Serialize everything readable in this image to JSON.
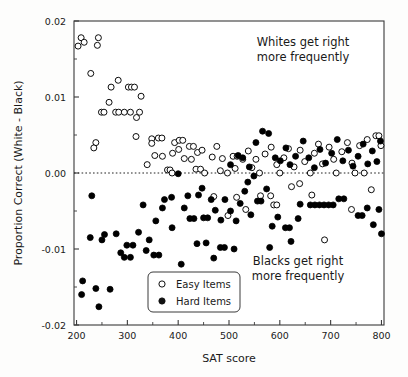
{
  "chart_data": {
    "type": "scatter",
    "title": "",
    "xlabel": "SAT score",
    "ylabel": "Proportion Correct (White - Black)",
    "xlim": [
      195,
      805
    ],
    "ylim": [
      -0.02,
      0.02
    ],
    "xticks": [
      200,
      300,
      400,
      500,
      600,
      700,
      800
    ],
    "xtick_labels": [
      "200",
      "300",
      "400",
      "500",
      "600",
      "700",
      "800"
    ],
    "xminor_step": 50,
    "yticks": [
      -0.02,
      -0.01,
      0.0,
      0.01,
      0.02
    ],
    "ytick_labels": [
      "-0.02",
      "-0.01",
      "0.00",
      "0.01",
      "0.02"
    ],
    "yminor_step": 0.005,
    "grid": false,
    "reference_line": {
      "y": 0.0,
      "style": "dotted"
    },
    "legend": {
      "position": "lower-center-left",
      "entries": [
        {
          "label": "Easy Items",
          "marker": "open-circle"
        },
        {
          "label": "Hard Items",
          "marker": "filled-circle"
        }
      ]
    },
    "annotations": [
      {
        "id": "whites-annotation",
        "line1": "Whites get right",
        "line2": "more frequently",
        "x": 610,
        "y": 0.0168
      },
      {
        "id": "blacks-annotation",
        "line1": "Blacks get right",
        "line2": "more frequently",
        "x": 600,
        "y": -0.0132
      }
    ],
    "series": [
      {
        "name": "Easy Items",
        "marker": "open-circle",
        "color": "#000000",
        "points": [
          [
            203,
            0.0167
          ],
          [
            209,
            0.0178
          ],
          [
            215,
            0.0172
          ],
          [
            243,
            0.0178
          ],
          [
            241,
            0.0168
          ],
          [
            228,
            0.0131
          ],
          [
            249,
            0.008
          ],
          [
            254,
            0.008
          ],
          [
            268,
            0.0113
          ],
          [
            264,
            0.0093
          ],
          [
            282,
            0.0122
          ],
          [
            277,
            0.008
          ],
          [
            283,
            0.008
          ],
          [
            294,
            0.008
          ],
          [
            302,
            0.0113
          ],
          [
            308,
            0.0113
          ],
          [
            314,
            0.0113
          ],
          [
            306,
            0.008
          ],
          [
            318,
            0.0073
          ],
          [
            327,
            0.0101
          ],
          [
            324,
            0.008
          ],
          [
            317,
            0.0048
          ],
          [
            238,
            0.004
          ],
          [
            234,
            0.0033
          ],
          [
            348,
            0.0045
          ],
          [
            348,
            0.0039
          ],
          [
            361,
            0.0046
          ],
          [
            368,
            0.0046
          ],
          [
            354,
            0.0023
          ],
          [
            369,
            0.0022
          ],
          [
            339,
            0.0011
          ],
          [
            379,
            0.0004
          ],
          [
            384,
            0.0004
          ],
          [
            393,
            0.004
          ],
          [
            389,
            0.0026
          ],
          [
            402,
            0.0043
          ],
          [
            409,
            0.0043
          ],
          [
            401,
            0.0031
          ],
          [
            412,
            0.0019
          ],
          [
            388,
            0.0
          ],
          [
            422,
            0.0035
          ],
          [
            430,
            0.0035
          ],
          [
            426,
            0.0018
          ],
          [
            438,
            0.0027
          ],
          [
            447,
            0.003
          ],
          [
            435,
            0.0005
          ],
          [
            444,
            0.0005
          ],
          [
            452,
            0.0
          ],
          [
            467,
            0.0021
          ],
          [
            476,
            0.0035
          ],
          [
            487,
            0.0019
          ],
          [
            483,
            0.0003
          ],
          [
            497,
            0.0
          ],
          [
            508,
            0.0022
          ],
          [
            516,
            0.0022
          ],
          [
            512,
            0.0006
          ],
          [
            527,
            0.0018
          ],
          [
            538,
            0.0029
          ],
          [
            545,
            0.0007
          ],
          [
            553,
            0.0018
          ],
          [
            560,
            0.0
          ],
          [
            571,
            0.0025
          ],
          [
            583,
            0.0034
          ],
          [
            594,
            0.0011
          ],
          [
            600,
            0.0
          ],
          [
            608,
            0.002
          ],
          [
            617,
            0.0032
          ],
          [
            628,
            0.0008
          ],
          [
            640,
            0.003
          ],
          [
            649,
            0.0015
          ],
          [
            660,
            0.0
          ],
          [
            668,
            0.0026
          ],
          [
            676,
            0.0038
          ],
          [
            684,
            0.0012
          ],
          [
            697,
            0.0034
          ],
          [
            706,
            0.0018
          ],
          [
            711,
            0.0
          ],
          [
            722,
            0.0028
          ],
          [
            733,
            0.004
          ],
          [
            742,
            0.0013
          ],
          [
            748,
            0.0
          ],
          [
            757,
            0.0036
          ],
          [
            766,
            0.0
          ],
          [
            772,
            0.0044
          ],
          [
            789,
            0.0049
          ],
          [
            795,
            0.0049
          ],
          [
            799,
            0.0036
          ],
          [
            688,
            -0.0088
          ],
          [
            562,
            -0.003
          ],
          [
            582,
            -0.003
          ],
          [
            588,
            -0.0042
          ],
          [
            594,
            -0.0042
          ],
          [
            533,
            -0.0048
          ],
          [
            515,
            -0.0032
          ],
          [
            498,
            -0.0056
          ],
          [
            470,
            -0.0031
          ],
          [
            623,
            -0.0018
          ],
          [
            639,
            -0.0014
          ],
          [
            663,
            -0.0029
          ],
          [
            741,
            -0.0048
          ],
          [
            780,
            -0.0022
          ]
        ]
      },
      {
        "name": "Hard Items",
        "marker": "filled-circle",
        "color": "#000000",
        "points": [
          [
            400,
            -0.0001
          ],
          [
            212,
            -0.0142
          ],
          [
            210,
            -0.016
          ],
          [
            238,
            -0.0152
          ],
          [
            244,
            -0.0176
          ],
          [
            266,
            -0.0153
          ],
          [
            227,
            -0.0085
          ],
          [
            250,
            -0.0088
          ],
          [
            255,
            -0.0081
          ],
          [
            278,
            -0.008
          ],
          [
            230,
            -0.003
          ],
          [
            287,
            -0.0105
          ],
          [
            299,
            -0.0095
          ],
          [
            311,
            -0.0095
          ],
          [
            294,
            -0.0111
          ],
          [
            306,
            -0.0111
          ],
          [
            322,
            -0.0078
          ],
          [
            331,
            -0.0042
          ],
          [
            343,
            -0.0088
          ],
          [
            352,
            -0.0108
          ],
          [
            362,
            -0.0108
          ],
          [
            337,
            -0.0102
          ],
          [
            356,
            -0.0063
          ],
          [
            369,
            -0.0046
          ],
          [
            388,
            -0.0072
          ],
          [
            373,
            -0.0035
          ],
          [
            387,
            -0.0032
          ],
          [
            406,
            -0.012
          ],
          [
            412,
            -0.0046
          ],
          [
            423,
            -0.006
          ],
          [
            431,
            -0.006
          ],
          [
            419,
            -0.003
          ],
          [
            440,
            -0.0029
          ],
          [
            450,
            -0.0059
          ],
          [
            458,
            -0.0059
          ],
          [
            447,
            -0.002
          ],
          [
            465,
            -0.0035
          ],
          [
            473,
            -0.0049
          ],
          [
            484,
            -0.0062
          ],
          [
            492,
            -0.0035
          ],
          [
            503,
            -0.005
          ],
          [
            514,
            -0.0063
          ],
          [
            522,
            -0.004
          ],
          [
            531,
            -0.0024
          ],
          [
            543,
            -0.0055
          ],
          [
            556,
            -0.0037
          ],
          [
            563,
            -0.0037
          ],
          [
            574,
            -0.0021
          ],
          [
            537,
            -0.0012
          ],
          [
            549,
            -0.0004
          ],
          [
            503,
            0.0011
          ],
          [
            518,
            0.0023
          ],
          [
            527,
            0.002
          ],
          [
            540,
            0.0008
          ],
          [
            553,
            0.004
          ],
          [
            566,
            0.0055
          ],
          [
            578,
            0.0052
          ],
          [
            591,
            0.002
          ],
          [
            601,
            0.0016
          ],
          [
            612,
            0.0033
          ],
          [
            620,
            0.0011
          ],
          [
            631,
            0.0022
          ],
          [
            646,
            0.0042
          ],
          [
            657,
            0.002
          ],
          [
            668,
            0.0007
          ],
          [
            679,
            0.0031
          ],
          [
            690,
            0.0013
          ],
          [
            702,
            0.0026
          ],
          [
            713,
            0.0044
          ],
          [
            724,
            0.0016
          ],
          [
            735,
            0.003
          ],
          [
            744,
            0.0009
          ],
          [
            754,
            0.0022
          ],
          [
            764,
            0.0038
          ],
          [
            773,
            0.0012
          ],
          [
            782,
            0.0029
          ],
          [
            791,
            0.0015
          ],
          [
            798,
            0.0042
          ],
          [
            660,
            -0.0042
          ],
          [
            669,
            -0.0042
          ],
          [
            678,
            -0.0042
          ],
          [
            687,
            -0.0042
          ],
          [
            696,
            -0.0042
          ],
          [
            705,
            -0.0042
          ],
          [
            640,
            -0.0041
          ],
          [
            716,
            -0.0034
          ],
          [
            726,
            -0.0034
          ],
          [
            754,
            -0.0056
          ],
          [
            762,
            -0.0056
          ],
          [
            772,
            -0.0046
          ],
          [
            784,
            -0.0068
          ],
          [
            795,
            -0.0048
          ],
          [
            800,
            -0.008
          ],
          [
            636,
            -0.006
          ],
          [
            611,
            -0.0072
          ],
          [
            619,
            -0.0072
          ],
          [
            596,
            -0.0058
          ],
          [
            585,
            -0.007
          ],
          [
            622,
            -0.009
          ],
          [
            580,
            -0.0098
          ],
          [
            483,
            -0.0098
          ],
          [
            491,
            -0.0098
          ],
          [
            510,
            -0.01
          ],
          [
            455,
            -0.0092
          ],
          [
            437,
            -0.0093
          ],
          [
            470,
            -0.0112
          ]
        ]
      }
    ]
  }
}
